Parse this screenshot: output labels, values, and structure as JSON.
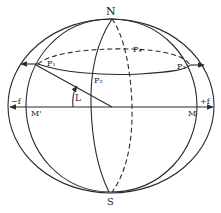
{
  "diagram": {
    "type": "celestial-sphere",
    "colors": {
      "stroke": "#2a2a2a",
      "background": "#ffffff"
    },
    "labels": {
      "north": "N",
      "south": "S",
      "p1": "P₁",
      "p2": "P₂",
      "p3": "P₃",
      "p4": "P₄",
      "angle": "L",
      "minus_f": "−f",
      "plus_f": "+f",
      "m_prime": "M'",
      "m": "M"
    }
  }
}
